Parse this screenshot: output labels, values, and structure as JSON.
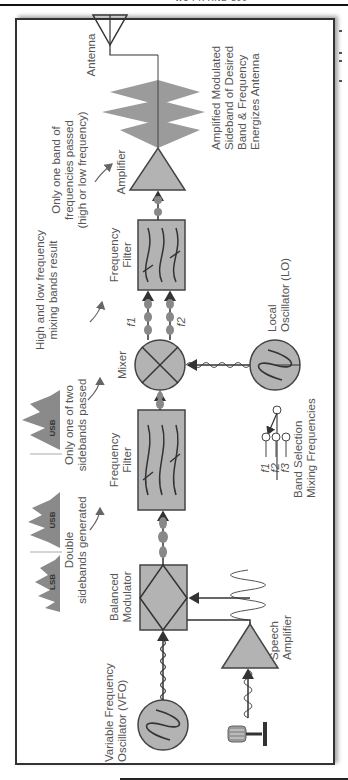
{
  "page": {
    "header_text": "W1 PR AND 390"
  },
  "diagram": {
    "blocks": {
      "vfo": {
        "line1": "Variable Frequency",
        "line2": "Oscillator (VFO)"
      },
      "balanced_modulator": {
        "line1": "Balanced",
        "line2": "Modulator"
      },
      "speech_amplifier": {
        "line1": "Speech",
        "line2": "Amplifier"
      },
      "filter1": {
        "line1": "Frequency",
        "line2": "Filter"
      },
      "mixer": {
        "label": "Mixer"
      },
      "local_oscillator": {
        "line1": "Local",
        "line2": "Oscillator (LO)"
      },
      "filter2": {
        "line1": "Frequency",
        "line2": "Filter"
      },
      "amplifier": {
        "label": "Amplifier"
      },
      "antenna": {
        "label": "Antenna"
      }
    },
    "annotations": {
      "double_sidebands": {
        "line1": "Double",
        "line2": "sidebands generated"
      },
      "one_sideband": {
        "line1": "Only one of two",
        "line2": "sidebands passed"
      },
      "mixing_bands": {
        "line1": "High and low frequency",
        "line2": "mixing bands result"
      },
      "one_band": {
        "line1": "Only one band of",
        "line2": "frequencies passed",
        "line3": "(high or low frequency)"
      },
      "output": {
        "line1": "Amplified Modulated",
        "line2": "Sideband of Desired",
        "line3": "Band & Frequency",
        "line4": "Energizes Antenna"
      },
      "band_selection": {
        "line1": "Band Selection",
        "line2": "Mixing Frequencies"
      }
    },
    "spectra": {
      "lsb_label": "LSB",
      "usb_label": "USB",
      "usb_only_label": "USB"
    },
    "mixer_outputs": {
      "f1": "f1",
      "f2": "f2"
    },
    "band_switch": {
      "f1": "f1",
      "f2": "f2",
      "f3": "f3"
    },
    "colors": {
      "block_fill": "#b3b3b3",
      "line": "#333333",
      "text": "#555555",
      "spectrum": "#8a8a8a"
    }
  }
}
